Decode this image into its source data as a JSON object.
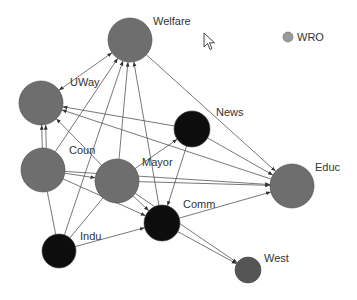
{
  "colors": {
    "gray_node": "#6e6e6e",
    "black_node": "#0d0d0d",
    "dark_node": "#555555",
    "legend_dot": "#9a9a9a",
    "edge": "#555555",
    "label": "#333333"
  },
  "legend": {
    "label": "WRO",
    "x": 288,
    "y": 37,
    "r": 5
  },
  "nodes": [
    {
      "id": "Welfare",
      "label": "Welfare",
      "x": 130,
      "y": 40,
      "r": 22,
      "fill": "gray_node",
      "lx": 153,
      "ly": 25
    },
    {
      "id": "UWay",
      "label": "UWay",
      "x": 41,
      "y": 103,
      "r": 22,
      "fill": "gray_node",
      "lx": 70,
      "ly": 86
    },
    {
      "id": "News",
      "label": "News",
      "x": 192,
      "y": 129,
      "r": 18,
      "fill": "black_node",
      "lx": 216,
      "ly": 116
    },
    {
      "id": "Coun",
      "label": "Coun",
      "x": 43,
      "y": 170,
      "r": 22,
      "fill": "gray_node",
      "lx": 69,
      "ly": 154
    },
    {
      "id": "Mayor",
      "label": "Mayor",
      "x": 117,
      "y": 181,
      "r": 22,
      "fill": "gray_node",
      "lx": 142,
      "ly": 166
    },
    {
      "id": "Educ",
      "label": "Educ",
      "x": 292,
      "y": 186,
      "r": 22,
      "fill": "gray_node",
      "lx": 315,
      "ly": 171
    },
    {
      "id": "Comm",
      "label": "Comm",
      "x": 162,
      "y": 223,
      "r": 18,
      "fill": "black_node",
      "lx": 183,
      "ly": 208
    },
    {
      "id": "Indu",
      "label": "Indu",
      "x": 59,
      "y": 251,
      "r": 17,
      "fill": "black_node",
      "lx": 80,
      "ly": 240
    },
    {
      "id": "West",
      "label": "West",
      "x": 248,
      "y": 270,
      "r": 13,
      "fill": "dark_node",
      "lx": 264,
      "ly": 262
    }
  ],
  "edges": [
    {
      "from": "Welfare",
      "to": "Educ"
    },
    {
      "from": "UWay",
      "to": "Welfare",
      "bidir": true
    },
    {
      "from": "Coun",
      "to": "UWay"
    },
    {
      "from": "Coun",
      "to": "UWay",
      "offset": 4
    },
    {
      "from": "Coun",
      "to": "Welfare"
    },
    {
      "from": "Indu",
      "to": "Welfare"
    },
    {
      "from": "Mayor",
      "to": "Welfare"
    },
    {
      "from": "Comm",
      "to": "Welfare"
    },
    {
      "from": "News",
      "to": "UWay"
    },
    {
      "from": "Educ",
      "to": "UWay"
    },
    {
      "from": "Mayor",
      "to": "UWay"
    },
    {
      "from": "Coun",
      "to": "Mayor"
    },
    {
      "from": "Coun",
      "to": "Educ"
    },
    {
      "from": "Coun",
      "to": "Comm"
    },
    {
      "from": "Mayor",
      "to": "News"
    },
    {
      "from": "Mayor",
      "to": "Educ"
    },
    {
      "from": "Mayor",
      "to": "Comm"
    },
    {
      "from": "Mayor",
      "to": "West"
    },
    {
      "from": "News",
      "to": "Comm"
    },
    {
      "from": "News",
      "to": "Educ"
    },
    {
      "from": "Indu",
      "to": "Comm"
    },
    {
      "from": "Indu",
      "to": "Coun",
      "noarrow": true
    },
    {
      "from": "Indu",
      "to": "Mayor",
      "noarrow": true
    },
    {
      "from": "Comm",
      "to": "Educ"
    },
    {
      "from": "Comm",
      "to": "West"
    }
  ],
  "cursor": {
    "type": "arrow-pointer",
    "x": 203,
    "y": 32
  }
}
